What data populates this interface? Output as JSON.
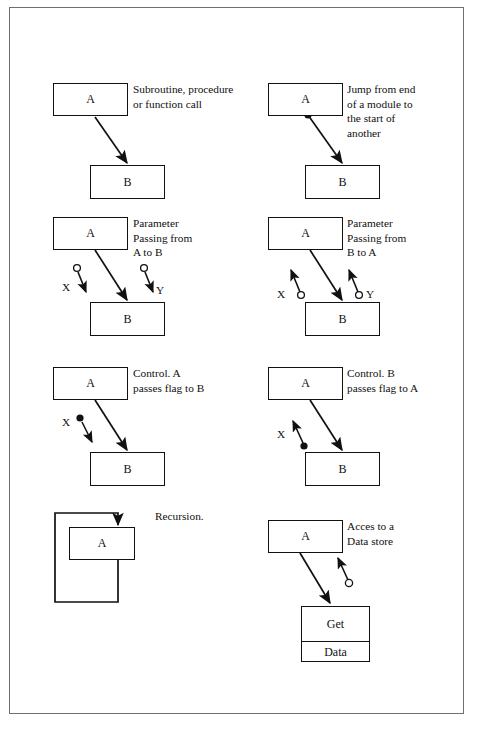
{
  "figure": {
    "bottom_caption": ""
  },
  "cells": [
    {
      "id": "subroutine-call",
      "caption": "Subroutine, procedure\nor function call",
      "boxes": [
        {
          "name": "box-a",
          "label": "A"
        },
        {
          "name": "box-b",
          "label": "B"
        }
      ],
      "connector_labels": []
    },
    {
      "id": "jump",
      "caption": "Jump from end\nof a module to\nthe start of\nanother",
      "boxes": [
        {
          "name": "box-a",
          "label": "A"
        },
        {
          "name": "box-b",
          "label": "B"
        }
      ],
      "connector_labels": []
    },
    {
      "id": "parameter-passing-a-to-b",
      "caption": "Parameter\nPassing from\nA to B",
      "boxes": [
        {
          "name": "box-a",
          "label": "A"
        },
        {
          "name": "box-b",
          "label": "B"
        }
      ],
      "connector_labels": [
        "X",
        "Y"
      ]
    },
    {
      "id": "parameter-passing-b-to-a",
      "caption": "Parameter\nPassing from\nB to A",
      "boxes": [
        {
          "name": "box-a",
          "label": "A"
        },
        {
          "name": "box-b",
          "label": "B"
        }
      ],
      "connector_labels": [
        "X",
        "Y"
      ]
    },
    {
      "id": "control-a-to-b",
      "caption": "Control. A\npasses flag to B",
      "boxes": [
        {
          "name": "box-a",
          "label": "A"
        },
        {
          "name": "box-b",
          "label": "B"
        }
      ],
      "connector_labels": [
        "X"
      ]
    },
    {
      "id": "control-b-to-a",
      "caption": "Control. B\npasses flag to A",
      "boxes": [
        {
          "name": "box-a",
          "label": "A"
        },
        {
          "name": "box-b",
          "label": "B"
        }
      ],
      "connector_labels": [
        "X"
      ]
    },
    {
      "id": "recursion",
      "caption": "Recursion.",
      "boxes": [
        {
          "name": "box-a",
          "label": "A"
        }
      ],
      "connector_labels": []
    },
    {
      "id": "data-store-access",
      "caption": "Acces to a\nData store",
      "boxes": [
        {
          "name": "box-a",
          "label": "A"
        },
        {
          "name": "datastore-top",
          "label": "Get"
        },
        {
          "name": "datastore-bottom",
          "label": "Data"
        }
      ],
      "connector_labels": []
    }
  ],
  "colors": {
    "line": "#111111",
    "frame": "#6f6f6f",
    "background": "#ffffff"
  }
}
